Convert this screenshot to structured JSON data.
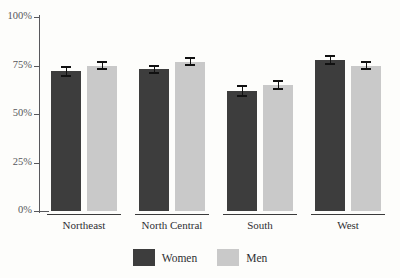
{
  "chart_data": {
    "type": "bar",
    "title": "",
    "title_cropped": true,
    "xlabel": "",
    "ylabel": "",
    "categories": [
      "Northeast",
      "North Central",
      "South",
      "West"
    ],
    "series": [
      {
        "name": "Women",
        "color": "#3d3d3d",
        "values": [
          72,
          73,
          62,
          78
        ],
        "errors": [
          3,
          2.5,
          3,
          2.5
        ]
      },
      {
        "name": "Men",
        "color": "#c9c9c9",
        "values": [
          75,
          77,
          65,
          75
        ],
        "errors": [
          2.5,
          2.5,
          2.5,
          2.5
        ]
      }
    ],
    "ylim": [
      0,
      100
    ],
    "yticks": [
      0,
      25,
      50,
      75,
      100
    ],
    "ytick_labels": [
      "0%",
      "25%",
      "50%",
      "75%",
      "100%"
    ],
    "grid": false,
    "legend_position": "bottom-center",
    "error_bars": true
  },
  "axis": {
    "ticks": [
      {
        "label": "100%",
        "value": 100
      },
      {
        "label": "75%",
        "value": 75
      },
      {
        "label": "50%",
        "value": 50
      },
      {
        "label": "25%",
        "value": 25
      },
      {
        "label": "0%",
        "value": 0
      }
    ]
  },
  "legend": {
    "items": [
      {
        "label": "Women",
        "color": "#3d3d3d"
      },
      {
        "label": "Men",
        "color": "#c9c9c9"
      }
    ]
  },
  "colors": {
    "women": "#3d3d3d",
    "men": "#c9c9c9",
    "axis": "#58585c",
    "text": "#2f2f33",
    "error": "#111111",
    "background": "#fdfdfb"
  }
}
